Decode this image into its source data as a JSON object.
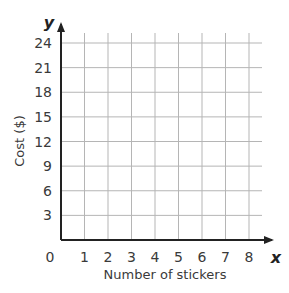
{
  "chart_data": {
    "type": "line",
    "title": "",
    "xlabel": "Number of stickers",
    "ylabel": "Cost ($)",
    "x_axis_var": "x",
    "y_axis_var": "y",
    "x_ticks": [
      "1",
      "2",
      "3",
      "4",
      "5",
      "6",
      "7",
      "8"
    ],
    "y_ticks": [
      "3",
      "6",
      "9",
      "12",
      "15",
      "18",
      "21",
      "24"
    ],
    "origin_label": "0",
    "xlim": [
      0,
      8
    ],
    "ylim": [
      0,
      24
    ],
    "grid": true,
    "series": [],
    "colors": {
      "grid": "#b5b5b5",
      "axis": "#222222",
      "text": "#3a3a3a"
    }
  }
}
